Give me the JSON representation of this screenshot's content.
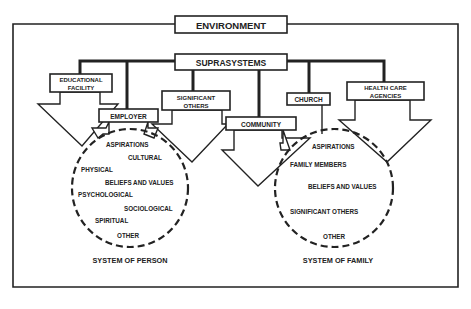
{
  "diagram": {
    "environment": {
      "label": "ENVIRONMENT"
    },
    "suprasystems": {
      "label": "SUPRASYSTEMS"
    },
    "suprasystem_nodes": [
      {
        "id": "educational-facility",
        "label_line1": "EDUCATIONAL",
        "label_line2": "FACILITY"
      },
      {
        "id": "employer",
        "label_line1": "EMPLOYER"
      },
      {
        "id": "significant-others",
        "label_line1": "SIGNIFICANT",
        "label_line2": "OTHERS"
      },
      {
        "id": "community",
        "label_line1": "COMMUNITY"
      },
      {
        "id": "church",
        "label_line1": "CHURCH"
      },
      {
        "id": "health-care-agencies",
        "label_line1": "HEALTH CARE",
        "label_line2": "AGENCIES"
      }
    ],
    "system_of_person": {
      "title": "SYSTEM OF PERSON",
      "items": [
        "ASPIRATIONS",
        "CULTURAL",
        "PHYSICAL",
        "BELIEFS AND VALUES",
        "PSYCHOLOGICAL",
        "SOCIOLOGICAL",
        "SPIRITUAL",
        "OTHER"
      ]
    },
    "system_of_family": {
      "title": "SYSTEM OF FAMILY",
      "items": [
        "ASPIRATIONS",
        "FAMILY MEMBERS",
        "BELIEFS AND VALUES",
        "SIGNIFICANT OTHERS",
        "OTHER"
      ]
    }
  }
}
